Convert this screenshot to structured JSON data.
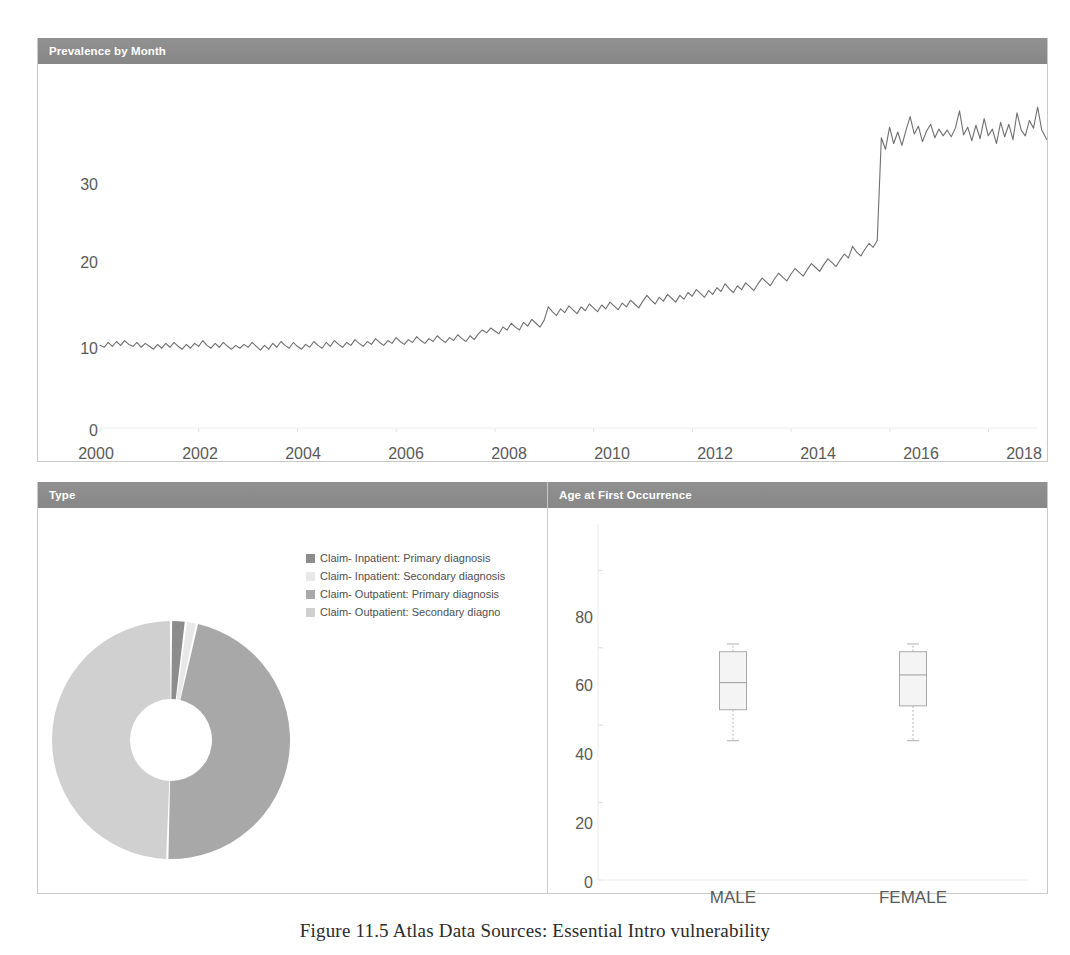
{
  "panels": {
    "prevalence": {
      "title": "Prevalence by Month"
    },
    "type": {
      "title": "Type"
    },
    "age": {
      "title": "Age at First Occurrence"
    }
  },
  "caption": {
    "text": "Figure 11.5  Atlas Data Sources: Essential Intro vulnerability"
  },
  "colors": {
    "header_bg": "#8c8c8c",
    "header_text": "#ffffff",
    "line": "#6f6f6f",
    "axis_text": "#5a5a5a",
    "panel_border": "#c9c9c9",
    "slice_inpatient_primary": "#8c8c8c",
    "slice_inpatient_secondary": "#e8e8e8",
    "slice_outpatient_primary": "#a8a8a8",
    "slice_outpatient_secondary": "#d0d0d0",
    "box_fill": "#f4f4f4",
    "box_stroke": "#aaaaaa"
  },
  "legend": {
    "items": [
      {
        "label": "Claim- Inpatient: Primary diagnosis",
        "color": "#8c8c8c"
      },
      {
        "label": "Claim- Inpatient: Secondary diagnosis",
        "color": "#e8e8e8"
      },
      {
        "label": "Claim- Outpatient: Primary diagnosis",
        "color": "#a8a8a8"
      },
      {
        "label": "Claim- Outpatient: Secondary diagno",
        "color": "#d0d0d0"
      }
    ]
  },
  "chart_data": [
    {
      "type": "line",
      "title": "Prevalence by Month",
      "xlabel": "",
      "ylabel": "",
      "xlim": [
        2000,
        2019
      ],
      "ylim": [
        0,
        36
      ],
      "ytick_labels": [
        "0",
        "10",
        "20",
        "30"
      ],
      "yticks": [
        0,
        10,
        20,
        30
      ],
      "xtick_labels": [
        "2000",
        "2002",
        "2004",
        "2006",
        "2008",
        "2010",
        "2012",
        "2014",
        "2016",
        "2018"
      ],
      "xticks": [
        2000,
        2002,
        2004,
        2006,
        2008,
        2010,
        2012,
        2014,
        2016,
        2018
      ],
      "grid": false,
      "legend_position": "none",
      "annotation": "Step increase in late 2015 (ICD-10 transition); sharp drop at end of series",
      "series": [
        {
          "name": "Prevalence per 1000 persons",
          "x_start": 2000.0,
          "x_step": 0.0833,
          "values": [
            8.6,
            8.4,
            8.9,
            8.5,
            9.0,
            8.6,
            9.1,
            8.7,
            8.5,
            8.9,
            8.4,
            8.8,
            8.5,
            8.2,
            8.7,
            8.3,
            8.8,
            8.4,
            8.9,
            8.5,
            8.2,
            8.7,
            8.3,
            8.8,
            8.5,
            9.1,
            8.6,
            8.3,
            8.8,
            8.4,
            8.9,
            8.5,
            8.2,
            8.6,
            8.3,
            8.7,
            8.4,
            8.9,
            8.5,
            8.1,
            8.6,
            8.2,
            8.8,
            8.4,
            9.0,
            8.6,
            8.3,
            8.9,
            8.5,
            8.2,
            8.7,
            8.4,
            9.0,
            8.6,
            8.3,
            8.9,
            8.5,
            9.1,
            8.7,
            8.4,
            8.9,
            8.6,
            9.2,
            8.8,
            8.5,
            9.0,
            8.7,
            9.3,
            8.9,
            8.6,
            9.1,
            8.8,
            9.4,
            9.0,
            8.7,
            9.2,
            8.9,
            9.5,
            9.1,
            8.8,
            9.3,
            9.0,
            9.6,
            9.2,
            8.9,
            9.4,
            9.1,
            9.7,
            9.3,
            9.0,
            9.6,
            9.2,
            9.8,
            10.2,
            9.9,
            10.4,
            10.1,
            9.8,
            10.5,
            10.2,
            10.9,
            10.5,
            10.2,
            11.0,
            10.6,
            11.3,
            10.9,
            10.5,
            11.2,
            12.6,
            12.1,
            11.7,
            12.4,
            12.0,
            12.7,
            12.3,
            11.9,
            12.6,
            12.2,
            12.9,
            12.5,
            12.1,
            12.8,
            12.4,
            13.1,
            12.7,
            12.3,
            13.0,
            12.6,
            13.3,
            12.9,
            12.5,
            13.2,
            13.8,
            13.3,
            12.9,
            13.6,
            13.2,
            13.9,
            13.5,
            13.1,
            13.8,
            13.4,
            14.1,
            13.7,
            14.4,
            14.0,
            13.6,
            14.3,
            13.9,
            14.6,
            14.2,
            15.0,
            14.5,
            14.1,
            14.8,
            14.4,
            15.1,
            14.7,
            14.3,
            15.0,
            15.6,
            15.2,
            14.8,
            15.5,
            16.1,
            15.7,
            15.3,
            16.0,
            16.6,
            16.2,
            15.8,
            16.5,
            17.1,
            16.7,
            16.3,
            17.0,
            17.6,
            17.2,
            16.8,
            17.5,
            18.1,
            17.7,
            18.9,
            18.3,
            17.9,
            18.6,
            19.2,
            18.8,
            19.5,
            30.2,
            29.0,
            31.3,
            29.6,
            30.8,
            29.4,
            31.0,
            32.4,
            30.6,
            31.4,
            29.8,
            30.9,
            31.6,
            30.2,
            31.1,
            30.4,
            31.0,
            30.3,
            31.2,
            33.0,
            30.5,
            31.3,
            29.9,
            31.5,
            30.1,
            32.2,
            30.4,
            31.1,
            29.6,
            31.8,
            30.3,
            31.6,
            30.0,
            32.8,
            31.0,
            30.4,
            32.0,
            31.2,
            33.4,
            31.0,
            30.2,
            29.5,
            23.2
          ]
        }
      ]
    },
    {
      "type": "pie",
      "title": "Type",
      "donut": true,
      "legend_position": "top-right",
      "labels": [
        "Claim- Inpatient: Primary diagnosis",
        "Claim- Inpatient: Secondary diagnosis",
        "Claim- Outpatient: Primary diagnosis",
        "Claim- Outpatient: Secondary diagno"
      ],
      "values": [
        2.0,
        1.5,
        47.0,
        49.5
      ],
      "colors": [
        "#8c8c8c",
        "#e8e8e8",
        "#a8a8a8",
        "#d0d0d0"
      ]
    },
    {
      "type": "box",
      "title": "Age at First Occurrence",
      "xlabel": "",
      "ylabel": "",
      "ylim": [
        0,
        92
      ],
      "yticks": [
        0,
        20,
        40,
        60,
        80
      ],
      "ytick_labels": [
        "0",
        "20",
        "40",
        "60",
        "80"
      ],
      "categories": [
        "MALE",
        "FEMALE"
      ],
      "boxes": [
        {
          "category": "MALE",
          "whisker_low": 36,
          "q1": 44,
          "median": 51,
          "q3": 59,
          "whisker_high": 61
        },
        {
          "category": "FEMALE",
          "whisker_low": 36,
          "q1": 45,
          "median": 53,
          "q3": 59,
          "whisker_high": 61
        }
      ]
    }
  ]
}
